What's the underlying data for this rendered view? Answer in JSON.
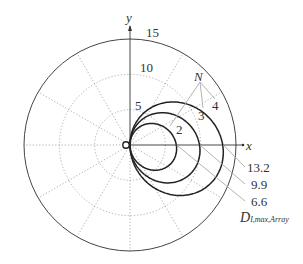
{
  "chart_data": {
    "type": "polar",
    "title": "",
    "axes": {
      "x_label": "x",
      "y_label": "y"
    },
    "radial_ticks": [
      5,
      10,
      15
    ],
    "radial_max": 15,
    "angular_grid_step_deg": 30,
    "grid": true,
    "series": [
      {
        "name": "N=2",
        "N": 2,
        "D_max": 6.6
      },
      {
        "name": "N=3",
        "N": 3,
        "D_max": 9.9
      },
      {
        "name": "N=4",
        "N": 4,
        "D_max": 13.2
      }
    ],
    "annotations": {
      "n_label": "N",
      "n_values": [
        "2",
        "3",
        "4"
      ],
      "dmax_values": [
        "13.2",
        "9.9",
        "6.6"
      ],
      "dmax_label_main": "D",
      "dmax_label_sub": "I,max,Array"
    }
  },
  "labels": {
    "y_axis": "y",
    "x_axis": "x",
    "r15": "15",
    "r10": "10",
    "r5": "5",
    "N": "N",
    "n2": "2",
    "n3": "3",
    "n4": "4",
    "d132": "13.2",
    "d99": "9.9",
    "d66": "6.6",
    "D": "D",
    "Dsub": "I,max,Array"
  }
}
